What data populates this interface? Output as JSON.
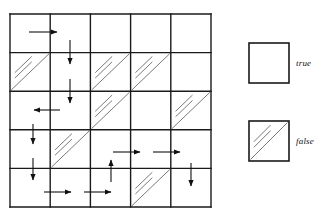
{
  "figure": {
    "title": ""
  },
  "grid": {
    "rows": 5,
    "cols": 5,
    "x0": 10,
    "y0": 14,
    "cell_w": 40.2,
    "cell_h": 38.6,
    "line_color": "#1a1a1a",
    "line_width": 1.4,
    "hatch_color": "#6b6b6b",
    "diagonal_cells": [
      {
        "row": 2,
        "col": 1
      },
      {
        "row": 2,
        "col": 3
      },
      {
        "row": 2,
        "col": 4
      },
      {
        "row": 3,
        "col": 3
      },
      {
        "row": 3,
        "col": 5
      },
      {
        "row": 4,
        "col": 2
      },
      {
        "row": 5,
        "col": 4
      }
    ],
    "arrows": [
      {
        "id": "a1",
        "dir": "right",
        "x1": 29,
        "y1": 32,
        "x2": 57,
        "y2": 32
      },
      {
        "id": "a2",
        "dir": "down",
        "x1": 70,
        "y1": 40,
        "x2": 70,
        "y2": 64
      },
      {
        "id": "a3",
        "dir": "down",
        "x1": 70,
        "y1": 79,
        "x2": 70,
        "y2": 103
      },
      {
        "id": "a4",
        "dir": "left",
        "x1": 60,
        "y1": 110,
        "x2": 34,
        "y2": 110
      },
      {
        "id": "a5",
        "dir": "down",
        "x1": 33,
        "y1": 124,
        "x2": 33,
        "y2": 144
      },
      {
        "id": "a6",
        "dir": "down",
        "x1": 33,
        "y1": 158,
        "x2": 33,
        "y2": 180
      },
      {
        "id": "a7",
        "dir": "right",
        "x1": 113,
        "y1": 152,
        "x2": 140,
        "y2": 152
      },
      {
        "id": "a8",
        "dir": "right",
        "x1": 153,
        "y1": 152,
        "x2": 180,
        "y2": 152
      },
      {
        "id": "a9",
        "dir": "up",
        "x1": 111,
        "y1": 182,
        "x2": 111,
        "y2": 160
      },
      {
        "id": "a10",
        "dir": "down",
        "x1": 191,
        "y1": 163,
        "x2": 191,
        "y2": 186
      },
      {
        "id": "a11",
        "dir": "right",
        "x1": 44,
        "y1": 192,
        "x2": 71,
        "y2": 192
      },
      {
        "id": "a12",
        "dir": "right",
        "x1": 84,
        "y1": 192,
        "x2": 111,
        "y2": 192
      }
    ]
  },
  "legend": {
    "items": [
      {
        "key": "true",
        "label": "true",
        "hatched": false,
        "box": {
          "x": 249,
          "y": 43,
          "w": 40,
          "h": 40
        }
      },
      {
        "key": "false",
        "label": "false",
        "hatched": true,
        "box": {
          "x": 249,
          "y": 121,
          "w": 40,
          "h": 40
        }
      }
    ]
  }
}
